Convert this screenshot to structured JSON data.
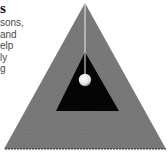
{
  "text_fragment": {
    "heading": "s",
    "lines": [
      "sons,",
      "and",
      "elp",
      "ly",
      "g"
    ]
  },
  "figure": {
    "colors": {
      "outer_triangle": "#7a7a7a",
      "inner_triangle": "#050505",
      "ball": "#f4f4f4",
      "string": "#e8e8e8",
      "background": "#ffffff"
    }
  }
}
